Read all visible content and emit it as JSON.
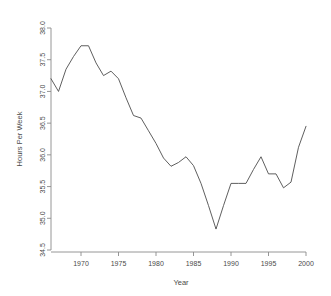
{
  "chart_data": {
    "type": "line",
    "title": "",
    "subtitle": "",
    "xlabel": "Year",
    "ylabel": "Hours Per Week",
    "xlim": [
      1966,
      2000
    ],
    "ylim": [
      34.5,
      38.0
    ],
    "xticks": [
      1970,
      1975,
      1980,
      1985,
      1990,
      1995,
      2000
    ],
    "xtick_labels": [
      "1970",
      "1975",
      "1980",
      "1985",
      "1990",
      "1995",
      "2000"
    ],
    "yticks": [
      34.5,
      35.0,
      35.5,
      36.0,
      36.5,
      37.0,
      37.5,
      38.0
    ],
    "ytick_labels": [
      "34.5",
      "35.0",
      "35.5",
      "36.0",
      "36.5",
      "37.0",
      "37.5",
      "38.0"
    ],
    "grid": false,
    "legend": null,
    "legend_position": "none",
    "line_color": "#4d4d4d",
    "line_width": 0.9,
    "background_color": "#ffffff",
    "axis_color": "#8a8a8a",
    "x": [
      1966,
      1967,
      1968,
      1969,
      1970,
      1971,
      1972,
      1973,
      1974,
      1975,
      1976,
      1977,
      1978,
      1979,
      1980,
      1981,
      1982,
      1983,
      1984,
      1985,
      1986,
      1987,
      1988,
      1989,
      1990,
      1991,
      1992,
      1993,
      1994,
      1995,
      1996,
      1997,
      1998,
      1999,
      2000
    ],
    "y": [
      37.2,
      37.0,
      37.35,
      37.55,
      37.72,
      37.72,
      37.45,
      37.25,
      37.32,
      37.2,
      36.9,
      36.62,
      36.58,
      36.38,
      36.18,
      35.95,
      35.82,
      35.88,
      35.97,
      35.83,
      35.55,
      35.2,
      34.83,
      35.2,
      35.55,
      35.55,
      35.55,
      35.77,
      35.97,
      35.7,
      35.7,
      35.48,
      35.57,
      36.12,
      36.45
    ],
    "series": [
      {
        "name": "Hours Per Week",
        "values": [
          37.2,
          37.0,
          37.35,
          37.55,
          37.72,
          37.72,
          37.45,
          37.25,
          37.32,
          37.2,
          36.9,
          36.62,
          36.58,
          36.38,
          36.18,
          35.95,
          35.82,
          35.88,
          35.97,
          35.83,
          35.55,
          35.2,
          34.83,
          35.2,
          35.55,
          35.55,
          35.55,
          35.77,
          35.97,
          35.7,
          35.7,
          35.48,
          35.57,
          36.12,
          36.45
        ]
      }
    ],
    "annotations": []
  }
}
